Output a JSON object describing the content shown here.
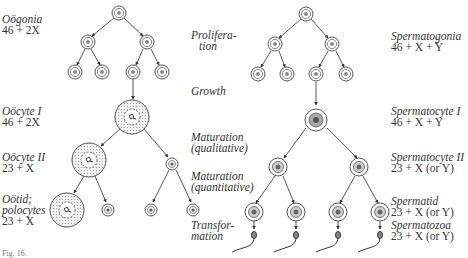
{
  "oogenesis": {
    "labels": [
      {
        "name": "Oögonia",
        "formula": "46 + 2X",
        "x": 2,
        "y": 4
      },
      {
        "name": "Oöcyte I",
        "formula": "46 + 2X",
        "x": 2,
        "y": 106
      },
      {
        "name": "Oöcyte II",
        "formula": "23 + X",
        "x": 2,
        "y": 152
      },
      {
        "name": "Oötid;",
        "name2": "polocytes",
        "formula": "23 + X",
        "x": 2,
        "y": 194
      }
    ]
  },
  "stages": [
    {
      "line1": "Prolifera-",
      "line2": "tion",
      "x": 190,
      "y": 30
    },
    {
      "line1": "Growth",
      "line2": "",
      "x": 190,
      "y": 86
    },
    {
      "line1": "Maturation",
      "line2": "(qualitative)",
      "x": 190,
      "y": 132
    },
    {
      "line1": "Maturation",
      "line2": "(quantitative)",
      "x": 190,
      "y": 171
    },
    {
      "line1": "Transfor-",
      "line2": "mation",
      "x": 190,
      "y": 218
    }
  ],
  "spermatogenesis": {
    "labels": [
      {
        "name": "Spermatogonia",
        "formula": "46 + X + Y",
        "x": 389,
        "y": 30
      },
      {
        "name": "Spermatocyte I",
        "formula": "46 + X + Y",
        "x": 389,
        "y": 107
      },
      {
        "name": "Spermatocyte II",
        "formula": "23 + X (or Y)",
        "x": 389,
        "y": 152
      },
      {
        "name": "Spermatid",
        "formula": "23 + X (or Y)",
        "x": 389,
        "y": 197
      },
      {
        "name": "Spermatozoa",
        "formula": "23 + X (or Y)",
        "x": 389,
        "y": 219
      }
    ]
  },
  "caption": {
    "text": "Fig. 16."
  },
  "colors": {
    "line": "#444444",
    "cell_ring": "#555555",
    "cytoplasm": "#c9c9c9"
  }
}
